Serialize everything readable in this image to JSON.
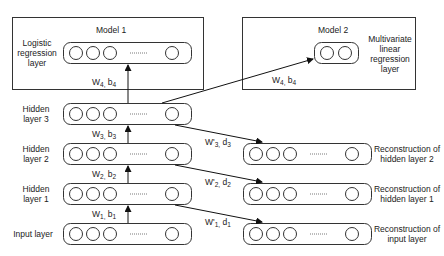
{
  "model1": {
    "title": "Model 1",
    "layer_label": "Logistic regression layer",
    "weights": {
      "w": "W",
      "w_sub": "4,",
      "b": " b",
      "b_sub": "4"
    }
  },
  "model2": {
    "title": "Model 2",
    "layer_label": "Multivariate linear regression layer",
    "weights": {
      "w": "W",
      "w_sub": "4,",
      "b": " b",
      "b_sub": "4"
    }
  },
  "encoder": {
    "layers": [
      {
        "label": "Hidden layer 3"
      },
      {
        "label": "Hidden layer 2"
      },
      {
        "label": "Hidden layer 1"
      },
      {
        "label": "Input layer"
      }
    ],
    "weights": [
      {
        "w": "W",
        "w_sub": "3,",
        "b": " b",
        "b_sub": "3"
      },
      {
        "w": "W",
        "w_sub": "2,",
        "b": " b",
        "b_sub": "2"
      },
      {
        "w": "W",
        "w_sub": "1,",
        "b": " b",
        "b_sub": "1"
      }
    ]
  },
  "decoder": {
    "layers": [
      {
        "label": "Reconstruction of hidden layer 2"
      },
      {
        "label": "Reconstruction of hidden layer 1"
      },
      {
        "label": "Reconstruction of input layer"
      }
    ],
    "weights": [
      {
        "w": "W'",
        "w_sub": "3,",
        "b": " d",
        "b_sub": "3"
      },
      {
        "w": "W'",
        "w_sub": "2,",
        "b": " d",
        "b_sub": "2"
      },
      {
        "w": "W'",
        "w_sub": "1,",
        "b": " d",
        "b_sub": "1"
      }
    ]
  },
  "ellipsis": "........."
}
